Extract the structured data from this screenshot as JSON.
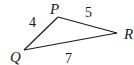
{
  "diagram": {
    "type": "triangle",
    "vertices": [
      {
        "name": "P",
        "x": 58,
        "y": 17,
        "label_x": 50,
        "label_y": 14
      },
      {
        "name": "Q",
        "x": 24,
        "y": 50,
        "label_x": 10,
        "label_y": 62
      },
      {
        "name": "R",
        "x": 117,
        "y": 33,
        "label_x": 124,
        "label_y": 39
      }
    ],
    "sides": [
      {
        "from": "Q",
        "to": "P",
        "length": "4",
        "label_x": 29,
        "label_y": 27
      },
      {
        "from": "P",
        "to": "R",
        "length": "5",
        "label_x": 85,
        "label_y": 17
      },
      {
        "from": "Q",
        "to": "R",
        "length": "7",
        "label_x": 65,
        "label_y": 63
      }
    ],
    "stroke_color": "#1a1a1a"
  }
}
